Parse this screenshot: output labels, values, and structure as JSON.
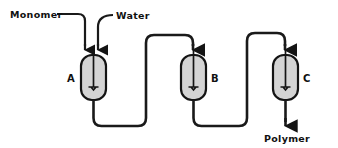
{
  "diagram": {
    "type": "process-flow-diagram",
    "background_color": "#ffffff",
    "line_color": "#1a1a1a",
    "vessel_fill_color": "#d4d4d4",
    "vessel_stroke_color": "#141414",
    "inputs": [
      {
        "id": "monomer",
        "label": "Monomer",
        "target": "A"
      },
      {
        "id": "water",
        "label": "Water",
        "target": "A"
      }
    ],
    "vessels": [
      {
        "id": "A",
        "label": "A",
        "label_side": "left",
        "type": "stirred-tank-reactor"
      },
      {
        "id": "B",
        "label": "B",
        "label_side": "right",
        "type": "stirred-tank-reactor"
      },
      {
        "id": "C",
        "label": "C",
        "label_side": "right",
        "type": "stirred-tank-reactor"
      }
    ],
    "connections": [
      {
        "from": "A",
        "to": "B",
        "style": "bottom-to-top-underpass"
      },
      {
        "from": "B",
        "to": "C",
        "style": "bottom-to-top-underpass"
      }
    ],
    "outputs": [
      {
        "id": "polymer",
        "label": "Polymer",
        "source": "C"
      }
    ]
  }
}
